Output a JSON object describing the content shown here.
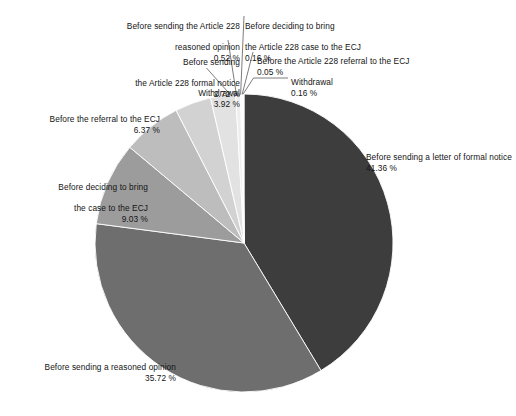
{
  "chart_data": {
    "type": "pie",
    "title": "",
    "subtitle": "",
    "xlabel": "",
    "ylabel": "",
    "legend_position": "callout-labels",
    "value_unit": "%",
    "total": 100.0,
    "categories": [
      "Before sending a letter of formal notice",
      "Before sending a reasoned opinion",
      "Before deciding to bring the case to the ECJ",
      "Before the referral to the ECJ",
      "Withdrawal",
      "Before sending the Article 228 formal notice",
      "Before sending the Article 228 reasoned opinion",
      "Before deciding to bring the Article 228 case to the ECJ",
      "Before the Article 228 referral to the ECJ",
      "Withdrawal"
    ],
    "values": [
      41.36,
      35.72,
      9.03,
      6.37,
      3.92,
      2.72,
      0.52,
      0.16,
      0.05,
      0.16
    ],
    "value_labels": [
      "41.36 %",
      "35.72 %",
      "9.03 %",
      "6.37 %",
      "3.92 %",
      "2.72 %",
      "0.52 %",
      "0.16 %",
      "0.05 %",
      "0.16 %"
    ],
    "colors": [
      "#3d3d3d",
      "#6e6e6e",
      "#9c9c9c",
      "#bdbdbd",
      "#d2d2d2",
      "#e2e2e2",
      "#eeeeee",
      "#f3f3f3",
      "#f7f7f7",
      "#fafafa"
    ],
    "start_angle_deg": 0,
    "direction": "clockwise"
  },
  "slices": {
    "formal_notice": {
      "label": "Before sending a letter of formal notice",
      "pct": "41.36 %",
      "color": "#3d3d3d"
    },
    "reasoned_opinion": {
      "label": "Before sending a reasoned opinion",
      "pct": "35.72 %",
      "color": "#6e6e6e"
    },
    "deciding_case": {
      "label_line1": "Before deciding to bring",
      "label_line2": "the case to the ECJ",
      "pct": "9.03 %",
      "color": "#9c9c9c"
    },
    "referral_ecj": {
      "label": "Before the referral to the ECJ",
      "pct": "6.37 %",
      "color": "#bdbdbd"
    },
    "withdrawal_392": {
      "label": "Withdrawal",
      "pct": "3.92 %",
      "color": "#d2d2d2"
    },
    "a228_formal": {
      "label_line1": "Before sending",
      "label_line2": "the Article 228 formal notice",
      "pct": "2.72 %",
      "color": "#e2e2e2"
    },
    "a228_reasoned": {
      "label_line1": "Before sending the Article 228",
      "label_line2": "reasoned opinion",
      "pct": "0.52 %",
      "color": "#eeeeee"
    },
    "a228_deciding": {
      "label_line1": "Before deciding to bring",
      "label_line2": "the Article 228 case to the ECJ",
      "pct": "0.16 %",
      "color": "#f3f3f3"
    },
    "a228_referral": {
      "label": "Before the Article 228 referral to the ECJ",
      "pct": "0.05 %",
      "color": "#f7f7f7"
    },
    "withdrawal_016": {
      "label": "Withdrawal",
      "pct": "0.16 %",
      "color": "#fafafa"
    }
  }
}
